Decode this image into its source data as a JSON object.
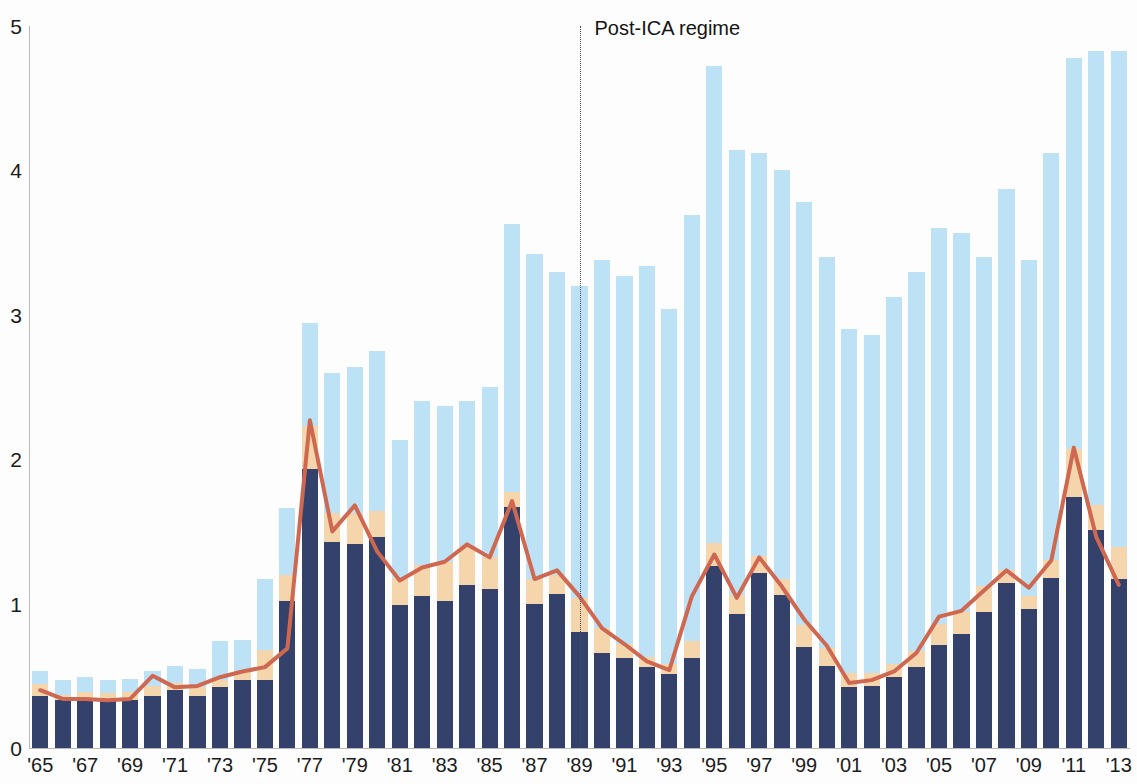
{
  "chart_data": {
    "type": "bar",
    "title": "",
    "subtitle": "",
    "xlabel": "",
    "ylabel": "",
    "ylim": [
      0,
      5
    ],
    "y_ticks": [
      "0",
      "1",
      "2",
      "3",
      "4",
      "5"
    ],
    "grid": false,
    "legend_position": "none",
    "x": [
      1965,
      1966,
      1967,
      1968,
      1969,
      1970,
      1971,
      1972,
      1973,
      1974,
      1975,
      1976,
      1977,
      1978,
      1979,
      1980,
      1981,
      1982,
      1983,
      1984,
      1985,
      1986,
      1987,
      1988,
      1989,
      1990,
      1991,
      1992,
      1993,
      1994,
      1995,
      1996,
      1997,
      1998,
      1999,
      2000,
      2001,
      2002,
      2003,
      2004,
      2005,
      2006,
      2007,
      2008,
      2009,
      2010,
      2011,
      2012,
      2013
    ],
    "x_tick_labels": [
      "'65",
      "'67",
      "'69",
      "'71",
      "'73",
      "'75",
      "'77",
      "'79",
      "'81",
      "'83",
      "'85",
      "'87",
      "'89",
      "'91",
      "'93",
      "'95",
      "'97",
      "'99",
      "'01",
      "'03",
      "'05",
      "'07",
      "'09",
      "'11",
      "'13"
    ],
    "x_tick_values": [
      1965,
      1967,
      1969,
      1971,
      1973,
      1975,
      1977,
      1979,
      1981,
      1983,
      1985,
      1987,
      1989,
      1991,
      1993,
      1995,
      1997,
      1999,
      2001,
      2003,
      2005,
      2007,
      2009,
      2011,
      2013
    ],
    "stacked": true,
    "series": [
      {
        "name": "base-segment",
        "color": "#33416b",
        "values": [
          0.36,
          0.33,
          0.33,
          0.33,
          0.33,
          0.36,
          0.4,
          0.36,
          0.42,
          0.47,
          0.47,
          1.02,
          1.93,
          1.43,
          1.41,
          1.46,
          0.99,
          1.05,
          1.02,
          1.13,
          1.1,
          1.67,
          1.0,
          1.07,
          0.8,
          0.66,
          0.62,
          0.56,
          0.51,
          0.62,
          1.26,
          0.93,
          1.21,
          1.06,
          0.7,
          0.57,
          0.42,
          0.43,
          0.49,
          0.56,
          0.71,
          0.79,
          0.94,
          1.14,
          0.96,
          1.18,
          1.74,
          1.51,
          1.17
        ]
      },
      {
        "name": "mid-segment",
        "color": "#f4d5ac",
        "values": [
          0.08,
          0.04,
          0.06,
          0.05,
          0.06,
          0.07,
          0.05,
          0.06,
          0.05,
          0.06,
          0.21,
          0.18,
          0.3,
          0.2,
          0.22,
          0.18,
          0.19,
          0.22,
          0.27,
          0.27,
          0.22,
          0.1,
          0.17,
          0.13,
          0.24,
          0.17,
          0.1,
          0.07,
          0.07,
          0.12,
          0.16,
          0.13,
          0.12,
          0.11,
          0.15,
          0.12,
          0.1,
          0.09,
          0.09,
          0.11,
          0.15,
          0.15,
          0.18,
          0.09,
          0.09,
          0.12,
          0.33,
          0.17,
          0.22
        ]
      },
      {
        "name": "top-segment",
        "color": "#bee2f5",
        "values": [
          0.09,
          0.1,
          0.1,
          0.09,
          0.09,
          0.1,
          0.12,
          0.13,
          0.27,
          0.22,
          0.49,
          0.46,
          0.71,
          0.97,
          1.01,
          1.11,
          0.95,
          1.13,
          1.08,
          1.0,
          1.18,
          1.86,
          2.25,
          2.1,
          2.16,
          2.55,
          2.55,
          2.71,
          2.46,
          2.95,
          3.3,
          3.08,
          2.79,
          2.83,
          2.93,
          2.71,
          2.38,
          2.34,
          2.54,
          2.63,
          2.74,
          2.63,
          2.28,
          2.64,
          2.33,
          2.82,
          2.71,
          3.15,
          3.44
        ]
      }
    ],
    "overlay_line": {
      "name": "price-line",
      "color": "#cf6851",
      "values": [
        0.4,
        0.34,
        0.34,
        0.33,
        0.34,
        0.5,
        0.42,
        0.43,
        0.49,
        0.53,
        0.56,
        0.69,
        2.27,
        1.5,
        1.68,
        1.36,
        1.16,
        1.25,
        1.29,
        1.41,
        1.32,
        1.71,
        1.17,
        1.23,
        1.05,
        0.83,
        0.72,
        0.6,
        0.54,
        1.05,
        1.34,
        1.04,
        1.32,
        1.12,
        0.89,
        0.71,
        0.45,
        0.47,
        0.53,
        0.66,
        0.91,
        0.95,
        1.09,
        1.23,
        1.11,
        1.3,
        2.08,
        1.46,
        1.13
      ]
    },
    "annotations": [
      {
        "name": "post-ica-regime",
        "label": "Post-ICA regime",
        "x_value": 1989,
        "line_style": "dotted",
        "color": "#4a4a6a"
      }
    ]
  }
}
